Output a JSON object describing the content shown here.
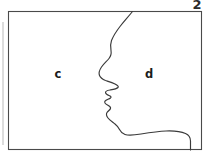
{
  "figure": {
    "kind": "face-profile-figure-ground-illusion",
    "background_color": "#ffffff",
    "line_color": "#3a3a3a",
    "frame_color": "#4a4a4a",
    "frame": {
      "x": 8,
      "y": 11,
      "width": 194,
      "height": 139
    },
    "corner_mark": {
      "text": "2",
      "note": "partially cropped numeral above the top-right of the frame",
      "x": 197,
      "y": 10
    },
    "labels": [
      {
        "id": "c",
        "text": "c",
        "x": 58,
        "y": 74,
        "region": "left-region"
      },
      {
        "id": "d",
        "text": "d",
        "x": 149,
        "y": 74,
        "region": "right-region"
      }
    ],
    "profile_outline": {
      "description": "human head in profile facing left: forehead, brow, nose, lips, chin, jaw and neck",
      "start_point": [
        132,
        11
      ],
      "end_point": [
        190,
        150
      ],
      "path": "M 132.5 11.5 C 128 17 124 21.5 120 26.5 C 116.5 31 113.5 35.5 111.5 40.5 C 110 44.5 110.5 47.5 111 50.5 C 111.5 53.5 111 56 109 58.5 C 106.5 61.5 103.5 64 101.5 67 C 99.5 70 98.5 73 99.5 75.5 C 100.5 78 103 79.5 105.5 80.5 C 108.5 81.5 112 82.5 115 84 C 117.5 85.2 119 86.5 118 87.5 C 116.5 89 113 89.5 110 90 C 107.5 90.4 105.5 91 105.5 92.5 C 105.5 94 107.5 95 109.5 95.8 C 111 96.4 111.5 97.2 110.5 98 C 109 99.2 106 99.8 105 101.2 C 104 102.6 105.5 104 107.5 105 C 109.5 106 111 107 110.5 108.5 C 110 110 108 111 107 112.5 C 106 114 106.5 116 108 118 C 109.5 120 112.5 122 115 124 C 117 125.6 118.5 127.5 119.5 129.5 C 120.5 131.5 122 133.5 125 134.5 C 129 135.8 135 135 141 134 C 149 132.7 158 131.3 166 131 C 174 130.7 181 131.5 185.5 133.5 C 189 135 190.5 137.5 190.5 141 L 190.5 150"
    },
    "margin_artifact": {
      "description": "faint vertical scan line along the left margin",
      "x": 3,
      "y1": 22,
      "y2": 145,
      "color": "#b9b9b9"
    }
  }
}
